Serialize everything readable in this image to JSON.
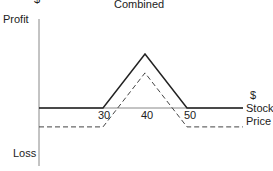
{
  "title": "Combined",
  "y_axis": {
    "top_label": "Profit",
    "bottom_label": "Loss",
    "unit": "$"
  },
  "x_axis": {
    "unit": "$",
    "label_line1": "Stock",
    "label_line2": "Price"
  },
  "ticks": [
    "30",
    "40",
    "50"
  ],
  "chart_data": {
    "type": "line",
    "title": "Combined",
    "xlabel": "$ Stock Price",
    "ylabel": "Profit / Loss",
    "x_ticks": [
      30,
      40,
      50
    ],
    "series": [
      {
        "name": "combined payoff",
        "style": "solid",
        "points": [
          [
            0,
            0
          ],
          [
            30,
            0
          ],
          [
            40,
            1
          ],
          [
            50,
            0
          ],
          [
            70,
            0
          ]
        ]
      },
      {
        "name": "combined profit (net of cost)",
        "style": "dashed",
        "points": [
          [
            0,
            -0.35
          ],
          [
            30,
            -0.35
          ],
          [
            40,
            0.65
          ],
          [
            50,
            -0.35
          ],
          [
            70,
            -0.35
          ]
        ]
      }
    ]
  }
}
